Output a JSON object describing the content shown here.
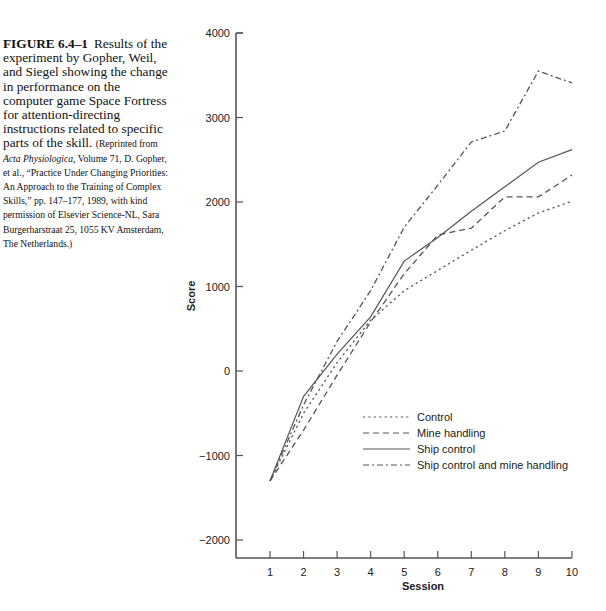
{
  "caption": {
    "figure_label": "FIGURE 6.4–1",
    "text": "Results of the experiment by Gopher, Weil, and Siegel showing the change in performance on the computer game Space Fortress for attention-directing instructions related to specific parts of the skill.",
    "note_prefix": "(Reprinted from ",
    "note_journal": "Acta Physiologica,",
    "note_rest": " Volume 71, D. Gopher, et al., “Practice Under Changing Priorities: An Approach to the Training of Complex Skills,” pp. 147–177, 1989, with kind permission of Elsevier Science-NL, Sara Burgerharstraat 25, 1055 KV Amsterdam, The Netherlands.)"
  },
  "chart_data": {
    "type": "line",
    "title": "",
    "xlabel": "Session",
    "ylabel": "Score",
    "x": [
      1,
      2,
      3,
      4,
      5,
      6,
      7,
      8,
      9,
      10
    ],
    "xticks": [
      "1",
      "2",
      "3",
      "4",
      "5",
      "6",
      "7",
      "8",
      "9",
      "10"
    ],
    "yticks": [
      "4000",
      "3000",
      "2000",
      "1000",
      "0",
      "−1000",
      "−2000"
    ],
    "ytick_values": [
      4000,
      3000,
      2000,
      1000,
      0,
      -1000,
      -2000
    ],
    "ylim": [
      -2200,
      4000
    ],
    "xlim": [
      0,
      10
    ],
    "grid": false,
    "legend_position": "lower right",
    "series": [
      {
        "name": "Control",
        "style": "dotted",
        "values": [
          -1300,
          -500,
          100,
          600,
          950,
          1190,
          1430,
          1660,
          1870,
          2010
        ]
      },
      {
        "name": "Mine handling",
        "style": "dashed",
        "values": [
          -1300,
          -700,
          -50,
          580,
          1150,
          1610,
          1690,
          2060,
          2060,
          2320
        ]
      },
      {
        "name": "Ship control",
        "style": "solid",
        "values": [
          -1300,
          -300,
          200,
          640,
          1300,
          1580,
          1890,
          2180,
          2470,
          2620
        ]
      },
      {
        "name": "Ship control and mine handling",
        "style": "dashdot",
        "values": [
          -1300,
          -400,
          350,
          950,
          1700,
          2200,
          2710,
          2840,
          3550,
          3410
        ]
      }
    ]
  },
  "colors": {
    "axis": "#555555",
    "series": "#555555"
  }
}
